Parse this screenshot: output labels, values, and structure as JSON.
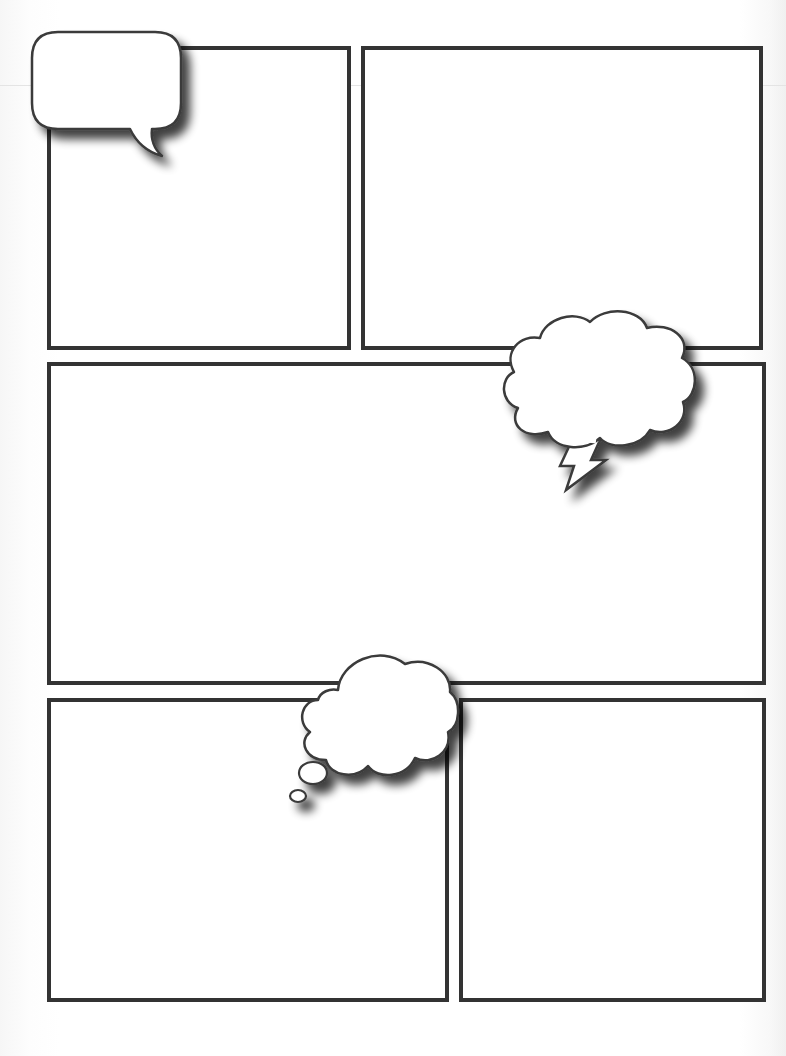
{
  "page": {
    "type": "blank comic page template",
    "background_color": "#ffffff",
    "border_color": "#333333"
  },
  "panels": [
    {
      "id": "top-left",
      "x": 47,
      "y": 46,
      "w": 304,
      "h": 304
    },
    {
      "id": "top-right",
      "x": 361,
      "y": 46,
      "w": 402,
      "h": 304
    },
    {
      "id": "middle-wide",
      "x": 47,
      "y": 362,
      "w": 719,
      "h": 323
    },
    {
      "id": "bottom-left",
      "x": 47,
      "y": 698,
      "w": 402,
      "h": 304
    },
    {
      "id": "bottom-right",
      "x": 459,
      "y": 698,
      "w": 307,
      "h": 304
    }
  ],
  "bubbles": [
    {
      "id": "speech-bubble",
      "kind": "speech",
      "text": ""
    },
    {
      "id": "shout-bubble",
      "kind": "thought-cloud-with-lightning-tail",
      "text": ""
    },
    {
      "id": "thought-bubble",
      "kind": "thought-cloud-with-dots",
      "text": ""
    }
  ]
}
